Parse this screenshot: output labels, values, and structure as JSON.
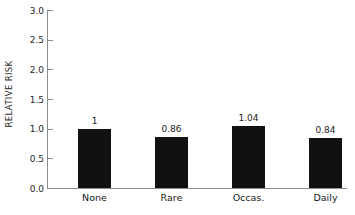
{
  "chart_data": {
    "type": "bar",
    "title": "",
    "xlabel": "",
    "ylabel": "RELATIVE RISK",
    "categories": [
      "None",
      "Rare",
      "Occas.",
      "Daily"
    ],
    "values": [
      1,
      0.86,
      1.04,
      0.84
    ],
    "value_labels": [
      "1",
      "0.86",
      "1.04",
      "0.84"
    ],
    "ylim": [
      0.0,
      3.0
    ],
    "ytick_values": [
      0.0,
      0.5,
      1.0,
      1.5,
      2.0,
      2.5,
      3.0
    ],
    "ytick_labels": [
      "0.0",
      "0.5",
      "1.0",
      "1.5",
      "2.0",
      "2.5",
      "3.0"
    ],
    "grid": false,
    "legend": false,
    "bar_color": "#111111",
    "axis_color": "#8c8c8c",
    "text_color": "#1a1a1a",
    "background": "#ffffff"
  },
  "axis": {
    "y_title": "RELATIVE RISK"
  },
  "ticks": [
    {
      "label": "3.0"
    },
    {
      "label": "2.5"
    },
    {
      "label": "2.0"
    },
    {
      "label": "1.5"
    },
    {
      "label": "1.0"
    },
    {
      "label": "0.5"
    },
    {
      "label": "0.0"
    }
  ],
  "bars": [
    {
      "category": "None",
      "value_label": "1"
    },
    {
      "category": "Rare",
      "value_label": "0.86"
    },
    {
      "category": "Occas.",
      "value_label": "1.04"
    },
    {
      "category": "Daily",
      "value_label": "0.84"
    }
  ]
}
